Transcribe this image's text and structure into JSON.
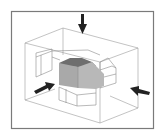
{
  "figure": {
    "title": "",
    "colors": {
      "frame": "#7a7a7a",
      "wireframe": "#9a9a9a",
      "object_face_front": "#a9a9a9",
      "object_face_side": "#b8b8b8",
      "object_face_top": "#6e6e6e",
      "arrow": "#222222",
      "background": "#ffffff"
    },
    "arrows": [
      {
        "name": "top-view-arrow",
        "direction": "down"
      },
      {
        "name": "front-view-arrow",
        "direction": "right"
      },
      {
        "name": "side-view-arrow",
        "direction": "left"
      }
    ]
  }
}
